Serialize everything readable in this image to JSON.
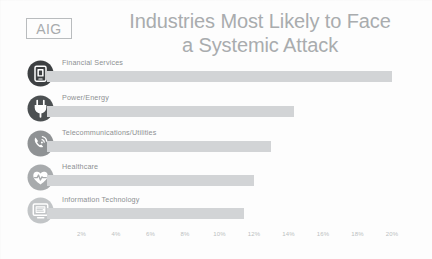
{
  "logo": {
    "text": "AIG",
    "icon": "aig-logo-box"
  },
  "title": {
    "line1": "Industries Most Likely to Face",
    "line2": "a Systemic Attack"
  },
  "chart_data": {
    "type": "bar",
    "orientation": "horizontal",
    "title": "Industries Most Likely to Face a Systemic Attack",
    "xlabel": "",
    "ylabel": "",
    "xlim": [
      0,
      20
    ],
    "grid": false,
    "legend": null,
    "categories": [
      "Financial Services",
      "Power/Energy",
      "Telecommunications/Utilities",
      "Healthcare",
      "Information Technology"
    ],
    "values": [
      20,
      14.3,
      13,
      12,
      11.4
    ],
    "tick_labels": [
      "2%",
      "4%",
      "6%",
      "8%",
      "10%",
      "12%",
      "14%",
      "16%",
      "18%",
      "20%"
    ],
    "tick_values": [
      2,
      4,
      6,
      8,
      10,
      12,
      14,
      16,
      18,
      20
    ],
    "bar_color": "#d2d4d6"
  },
  "rows": [
    {
      "label": "Financial Services",
      "value": 20,
      "icon": "mobile-banking-icon",
      "icon_color": "#3d4042"
    },
    {
      "label": "Power/Energy",
      "value": 14.3,
      "icon": "power-plug-icon",
      "icon_color": "#4c5052"
    },
    {
      "label": "Telecommunications/Utilities",
      "value": 13,
      "icon": "telephone-signal-icon",
      "icon_color": "#8f9294"
    },
    {
      "label": "Healthcare",
      "value": 12,
      "icon": "heart-pulse-icon",
      "icon_color": "#a8abad"
    },
    {
      "label": "Information Technology",
      "value": 11.4,
      "icon": "computer-monitor-icon",
      "icon_color": "#c2c5c7"
    }
  ],
  "colors": {
    "title": "#a9acae",
    "label": "#8d9092",
    "bar": "#d2d4d6",
    "axis_label": "#bcbfc1",
    "background": "#fdfdfd"
  }
}
